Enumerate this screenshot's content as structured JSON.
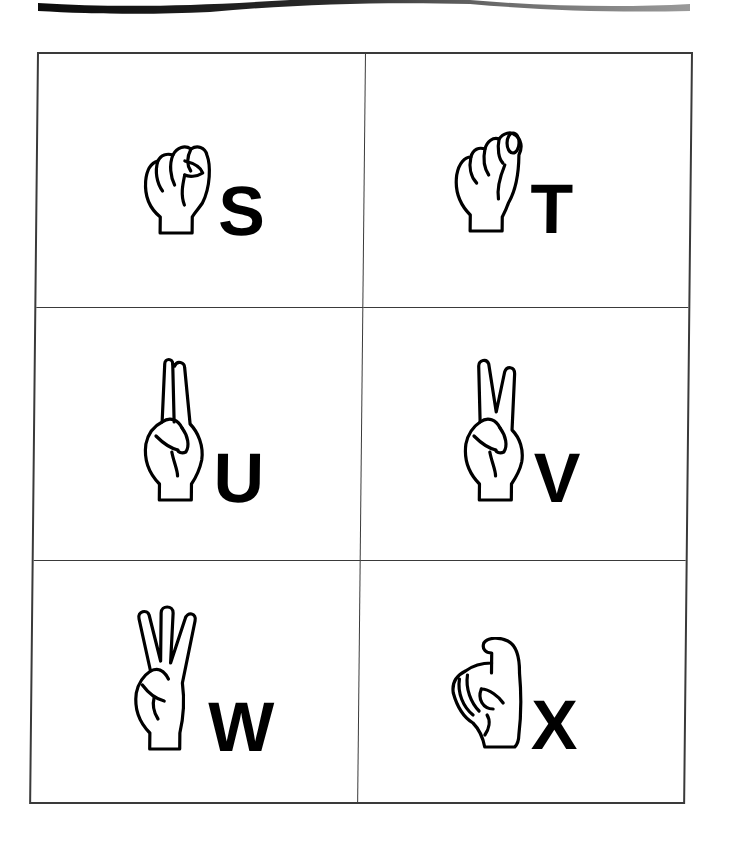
{
  "page": {
    "swoosh_colors": {
      "dark": "#111111",
      "light": "#8a8a8a"
    },
    "border_color": "#3a3a3a"
  },
  "cards": [
    {
      "letter": "S",
      "icon": "fist-hand-s-icon",
      "description": "Closed fist, thumb across fingers"
    },
    {
      "letter": "T",
      "icon": "fist-hand-t-icon",
      "description": "Fist with thumb tucked between index and middle"
    },
    {
      "letter": "U",
      "icon": "two-fingers-together-hand-icon",
      "description": "Index and middle fingers up together"
    },
    {
      "letter": "V",
      "icon": "two-fingers-spread-hand-icon",
      "description": "Index and middle fingers up, spread"
    },
    {
      "letter": "W",
      "icon": "three-fingers-spread-hand-icon",
      "description": "Three fingers up, spread"
    },
    {
      "letter": "X",
      "icon": "hooked-index-hand-icon",
      "description": "Index finger hooked"
    }
  ]
}
